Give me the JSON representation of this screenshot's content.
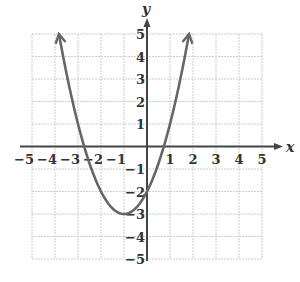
{
  "chart_data": {
    "type": "line",
    "title": "",
    "xlabel": "x",
    "ylabel": "y",
    "xlim": [
      -5,
      5
    ],
    "ylim": [
      -5,
      5
    ],
    "grid": true,
    "x_ticks": [
      "-5",
      "-4",
      "-3",
      "-2",
      "-1",
      "1",
      "2",
      "3",
      "4",
      "5"
    ],
    "y_ticks": [
      "5",
      "4",
      "3",
      "2",
      "1",
      "-1",
      "-2",
      "-3",
      "-4",
      "-5"
    ],
    "series": [
      {
        "name": "parabola",
        "equation": "y = x^2 + 2x - 2",
        "vertex": [
          -1,
          -3
        ],
        "y_intercept": -2,
        "x_intercepts": [
          -2.73,
          0.73
        ],
        "endpoints_with_arrows": [
          [
            -3.83,
            5
          ],
          [
            1.83,
            5
          ]
        ],
        "x": [
          -3.83,
          -3,
          -2,
          -1,
          0,
          1,
          1.83
        ],
        "values": [
          5,
          1,
          -2,
          -3,
          -2,
          1,
          5
        ]
      }
    ]
  },
  "colors": {
    "curve": "#666666",
    "axes": "#444444",
    "grid": "#cccccc"
  }
}
